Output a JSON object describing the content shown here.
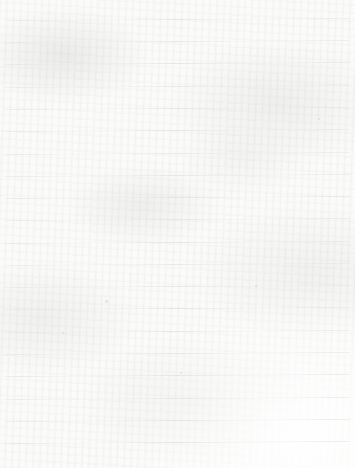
{
  "document": {
    "type": "ruled-paper",
    "title": "Blank lined notebook paper",
    "has_text": false,
    "has_handwriting": false,
    "text_content": "",
    "orientation": "portrait",
    "page_width": 355,
    "page_height": 468
  },
  "paper": {
    "background_color": "#fbfbfa",
    "edge_color": "#ffffff",
    "texture": "scanned paper with faint mottling and fiber grain"
  },
  "ruling": {
    "line_color": "#e3e5e6",
    "line_thickness": 1,
    "line_count": 20,
    "first_line_y": 20,
    "line_spacing": 22.3,
    "line_start_x": 4,
    "line_end_x": 350,
    "tilt_degrees": -0.32,
    "margin_rule": false,
    "line_positions_y": [
      20,
      42,
      64,
      87,
      109,
      131,
      154,
      176,
      198,
      220,
      243,
      265,
      287,
      309,
      332,
      354,
      376,
      399,
      421,
      443
    ]
  },
  "specks": [
    {
      "x": 105,
      "y": 300,
      "size": 3
    },
    {
      "x": 255,
      "y": 285,
      "size": 2
    },
    {
      "x": 62,
      "y": 332,
      "size": 2
    },
    {
      "x": 318,
      "y": 118,
      "size": 2
    },
    {
      "x": 180,
      "y": 372,
      "size": 2
    }
  ]
}
